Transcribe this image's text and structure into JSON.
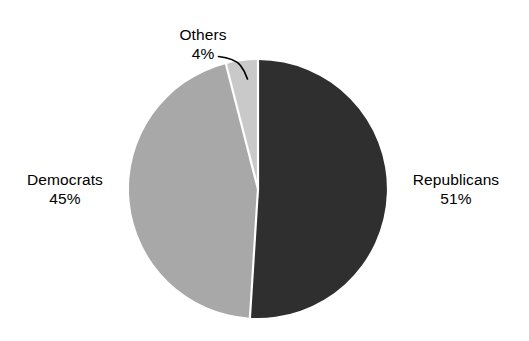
{
  "chart_data": {
    "type": "pie",
    "title": "",
    "subtitle": "",
    "xlabel": "",
    "ylabel": "",
    "grid": false,
    "legend_position": "none",
    "labels_outside": true,
    "total_percent": 100,
    "categories": [
      "Republicans",
      "Democrats",
      "Others"
    ],
    "values": [
      51,
      45,
      4
    ],
    "value_unit": "%",
    "start_angle_deg": 0,
    "direction": "clockwise",
    "slices": [
      {
        "label": "Republicans",
        "value": 51,
        "value_text": "51%",
        "color": "#2f2f2f",
        "start_angle_deg": 0,
        "end_angle_deg": 183.6,
        "label_position": "right",
        "has_leader_line": false
      },
      {
        "label": "Democrats",
        "value": 45,
        "value_text": "45%",
        "color": "#a8a8a8",
        "start_angle_deg": 183.6,
        "end_angle_deg": 345.6,
        "label_position": "left",
        "has_leader_line": false
      },
      {
        "label": "Others",
        "value": 4,
        "value_text": "4%",
        "color": "#c9c9c9",
        "start_angle_deg": 345.6,
        "end_angle_deg": 360,
        "label_position": "top",
        "has_leader_line": true
      }
    ],
    "annotations": [
      {
        "name": "others-leader-line",
        "from_label": "Others",
        "to_slice": "Others"
      }
    ],
    "geometry": {
      "center_x": 258,
      "center_y": 189,
      "radius": 129,
      "separator_color": "#ffffff",
      "separator_width": 2.2,
      "background": "#ffffff"
    }
  },
  "labels": {
    "republicans": {
      "name": "Republicans",
      "value": "51%"
    },
    "democrats": {
      "name": "Democrats",
      "value": "45%"
    },
    "others": {
      "name": "Others",
      "value": "4%"
    }
  }
}
